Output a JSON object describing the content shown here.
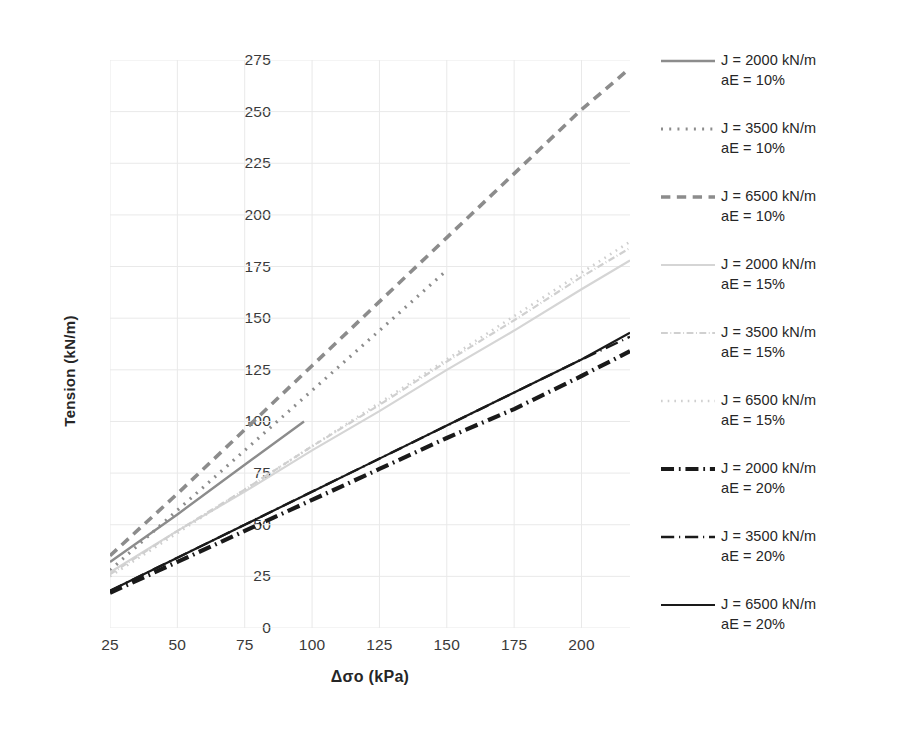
{
  "chart_data": {
    "type": "line",
    "title": "",
    "xlabel": "Δσo (kPa)",
    "ylabel": "Tension (kN/m)",
    "xlim": [
      25,
      218
    ],
    "ylim": [
      0,
      275
    ],
    "xticks": [
      25,
      50,
      75,
      100,
      125,
      150,
      175,
      200
    ],
    "yticks": [
      0,
      25,
      50,
      75,
      100,
      125,
      150,
      175,
      200,
      225,
      250,
      275
    ],
    "grid": true,
    "legend_position": "right",
    "x": [
      25,
      50,
      75,
      100,
      125,
      150,
      175,
      200,
      218
    ],
    "series": [
      {
        "name": "J = 2000 kN/m aE = 10%",
        "J": 2000,
        "aE": "10%",
        "color": "#8c8c8c",
        "dash": "solid",
        "width": 2.4,
        "x": [
          25,
          50,
          75,
          97
        ],
        "values": [
          32,
          55,
          79,
          100
        ]
      },
      {
        "name": "J = 3500 kN/m aE = 10%",
        "J": 3500,
        "aE": "10%",
        "color": "#8c8c8c",
        "dash": "dotted",
        "width": 3.2,
        "x": [
          25,
          50,
          75,
          100,
          125,
          149
        ],
        "values": [
          28,
          57,
          86,
          115,
          144,
          172
        ]
      },
      {
        "name": "J = 6500 kN/m aE = 10%",
        "J": 6500,
        "aE": "10%",
        "color": "#8c8c8c",
        "dash": "dashed",
        "width": 3.6,
        "x": [
          25,
          50,
          75,
          100,
          125,
          150,
          175,
          200,
          218
        ],
        "values": [
          35,
          65,
          96,
          127,
          158,
          189,
          220,
          251,
          271
        ]
      },
      {
        "name": "J = 2000 kN/m aE = 15%",
        "J": 2000,
        "aE": "15%",
        "color": "#d5d5d5",
        "dash": "solid",
        "width": 2.2,
        "x": [
          25,
          50,
          75,
          100,
          125,
          150,
          175,
          200,
          218
        ],
        "values": [
          27,
          47,
          66,
          86,
          105,
          125,
          144,
          164,
          178
        ]
      },
      {
        "name": "J = 3500 kN/m aE = 15%",
        "J": 3500,
        "aE": "15%",
        "color": "#d0d0d0",
        "dash": "dashdot",
        "width": 2.2,
        "x": [
          25,
          50,
          75,
          100,
          125,
          150,
          175,
          200,
          218
        ],
        "values": [
          26,
          47,
          67,
          88,
          108,
          129,
          149,
          170,
          184
        ]
      },
      {
        "name": "J = 6500 kN/m aE = 15%",
        "J": 6500,
        "aE": "15%",
        "color": "#cfcfcf",
        "dash": "dotted",
        "width": 2.6,
        "x": [
          25,
          50,
          75,
          100,
          125,
          150,
          175,
          200,
          218
        ],
        "values": [
          25,
          46,
          67,
          88,
          109,
          130,
          151,
          172,
          187
        ]
      },
      {
        "name": "J = 2000 kN/m aE = 20%",
        "J": 2000,
        "aE": "20%",
        "color": "#1a1a1a",
        "dash": "dashdot",
        "width": 4.2,
        "x": [
          25,
          50,
          75,
          100,
          125,
          150,
          175,
          200,
          218
        ],
        "values": [
          17,
          32,
          47,
          62,
          77,
          92,
          106,
          122,
          134
        ]
      },
      {
        "name": "J = 3500 kN/m aE = 20%",
        "J": 3500,
        "aE": "20%",
        "color": "#1a1a1a",
        "dash": "dashdot-fine",
        "width": 2.4,
        "x": [
          25,
          50,
          75,
          100,
          125,
          150,
          175,
          200,
          218
        ],
        "values": [
          18,
          34,
          50,
          66,
          82,
          98,
          114,
          130,
          141
        ]
      },
      {
        "name": "J = 6500 kN/m aE = 20%",
        "J": 6500,
        "aE": "20%",
        "color": "#1a1a1a",
        "dash": "solid",
        "width": 2.2,
        "x": [
          25,
          50,
          75,
          100,
          125,
          150,
          175,
          200,
          218
        ],
        "values": [
          18,
          34,
          50,
          66,
          82,
          98,
          114,
          130,
          143
        ]
      }
    ]
  },
  "axes": {
    "ylabel": "Tension (kN/m)",
    "xlabel": "Δσo (kPa)",
    "ytick_labels": [
      "0",
      "25",
      "50",
      "75",
      "100",
      "125",
      "150",
      "175",
      "200",
      "225",
      "250",
      "275"
    ],
    "xtick_labels": [
      "25",
      "50",
      "75",
      "100",
      "125",
      "150",
      "175",
      "200"
    ]
  },
  "legend": {
    "items": [
      {
        "line1": "J = 2000 kN/m",
        "line2": "aE = 10%",
        "color": "#8c8c8c",
        "dash": "solid",
        "width": 2.4
      },
      {
        "line1": "J = 3500 kN/m",
        "line2": "aE = 10%",
        "color": "#8c8c8c",
        "dash": "dotted",
        "width": 3.2
      },
      {
        "line1": "J = 6500 kN/m",
        "line2": "aE = 10%",
        "color": "#8c8c8c",
        "dash": "dashed",
        "width": 3.6
      },
      {
        "line1": "J = 2000 kN/m",
        "line2": "aE = 15%",
        "color": "#d5d5d5",
        "dash": "solid",
        "width": 2.2
      },
      {
        "line1": "J = 3500 kN/m",
        "line2": "aE = 15%",
        "color": "#d0d0d0",
        "dash": "dashdot",
        "width": 2.2
      },
      {
        "line1": "J = 6500 kN/m",
        "line2": "aE = 15%",
        "color": "#cfcfcf",
        "dash": "dotted",
        "width": 2.6
      },
      {
        "line1": "J = 2000 kN/m",
        "line2": "aE = 20%",
        "color": "#1a1a1a",
        "dash": "dashdot",
        "width": 4.2
      },
      {
        "line1": "J = 3500 kN/m",
        "line2": "aE = 20%",
        "color": "#1a1a1a",
        "dash": "dashdot-fine",
        "width": 2.4
      },
      {
        "line1": "J = 6500 kN/m",
        "line2": "aE = 20%",
        "color": "#1a1a1a",
        "dash": "solid",
        "width": 2.2
      }
    ]
  },
  "style": {
    "grid_color": "#e9e9e9",
    "background": "#ffffff",
    "text_color": "#262626"
  }
}
